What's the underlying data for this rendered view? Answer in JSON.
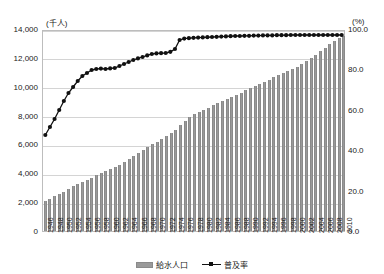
{
  "chart_data": {
    "type": "bar",
    "title": "",
    "subtitle": "",
    "xlabel": "",
    "ylabel": "",
    "grid": true,
    "legend_position": "bottom",
    "left_axis": {
      "unit_caption": "(千人)",
      "ticks": [
        "0",
        "2,000",
        "4,000",
        "6,000",
        "8,000",
        "10,000",
        "12,000",
        "14,000"
      ],
      "tick_values": [
        0,
        2000,
        4000,
        6000,
        8000,
        10000,
        12000,
        14000
      ],
      "ylim": [
        0,
        14000
      ]
    },
    "right_axis": {
      "unit_caption": "(%)",
      "ticks": [
        "0.0",
        "20.0",
        "40.0",
        "60.0",
        "80.0",
        "100.0"
      ],
      "tick_values": [
        0,
        20,
        40,
        60,
        80,
        100
      ],
      "ylim": [
        0,
        100
      ]
    },
    "x": [
      1946,
      1947,
      1948,
      1949,
      1950,
      1951,
      1952,
      1953,
      1954,
      1955,
      1956,
      1957,
      1958,
      1959,
      1960,
      1961,
      1962,
      1963,
      1964,
      1965,
      1966,
      1967,
      1968,
      1969,
      1970,
      1971,
      1972,
      1973,
      1974,
      1975,
      1976,
      1977,
      1978,
      1979,
      1980,
      1981,
      1982,
      1983,
      1984,
      1985,
      1986,
      1987,
      1988,
      1989,
      1990,
      1991,
      1992,
      1993,
      1994,
      1995,
      1996,
      1997,
      1998,
      1999,
      2000,
      2001,
      2002,
      2003,
      2004,
      2005,
      2006,
      2007,
      2008,
      2009,
      2010
    ],
    "xticklabels": [
      "1946",
      "1948",
      "1950",
      "1952",
      "1954",
      "1956",
      "1958",
      "1960",
      "1962",
      "1964",
      "1966",
      "1968",
      "1970",
      "1972",
      "1974",
      "1976",
      "1978",
      "1980",
      "1982",
      "1984",
      "1986",
      "1988",
      "1990",
      "1992",
      "1994",
      "1996",
      "1998",
      "2000",
      "2002",
      "2004",
      "2006",
      "2008",
      "2010"
    ],
    "xticklabel_step": 2,
    "series": [
      {
        "name": "給水人口",
        "type": "bar",
        "axis": "left",
        "unit": "千人",
        "color": "#9a9a9a",
        "values": [
          2100,
          2250,
          2400,
          2550,
          2700,
          2900,
          3100,
          3250,
          3400,
          3550,
          3700,
          3850,
          4000,
          4150,
          4300,
          4450,
          4600,
          4800,
          5000,
          5200,
          5400,
          5600,
          5800,
          6000,
          6200,
          6400,
          6600,
          6800,
          7000,
          7350,
          7650,
          7900,
          8100,
          8250,
          8400,
          8550,
          8700,
          8850,
          9000,
          9150,
          9300,
          9450,
          9600,
          9750,
          9900,
          10050,
          10200,
          10350,
          10500,
          10650,
          10800,
          10950,
          11100,
          11250,
          11400,
          11600,
          11800,
          12000,
          12200,
          12450,
          12700,
          12950,
          13150,
          13350,
          13500
        ]
      },
      {
        "name": "普及率",
        "type": "line",
        "axis": "right",
        "unit": "%",
        "color": "#111111",
        "marker": "circle",
        "values": [
          48.0,
          52.0,
          56.0,
          60.5,
          65.0,
          69.0,
          72.0,
          75.0,
          77.5,
          79.0,
          80.5,
          81.0,
          81.2,
          81.0,
          81.3,
          81.5,
          82.5,
          83.5,
          84.5,
          85.5,
          86.3,
          87.0,
          87.8,
          88.5,
          88.8,
          88.9,
          89.0,
          89.6,
          91.0,
          95.5,
          96.2,
          96.4,
          96.6,
          96.7,
          96.8,
          96.9,
          97.0,
          97.1,
          97.2,
          97.3,
          97.4,
          97.5,
          97.5,
          97.6,
          97.6,
          97.7,
          97.7,
          97.8,
          97.8,
          97.8,
          97.9,
          97.9,
          97.9,
          98.0,
          98.0,
          98.0,
          98.0,
          98.0,
          98.0,
          98.0,
          98.0,
          98.0,
          98.0,
          98.0,
          98.0
        ]
      }
    ]
  },
  "legend": {
    "items": [
      {
        "label": "給水人口",
        "marker": "bar-swatch"
      },
      {
        "label": "普及率",
        "marker": "line-marker-swatch"
      }
    ]
  }
}
